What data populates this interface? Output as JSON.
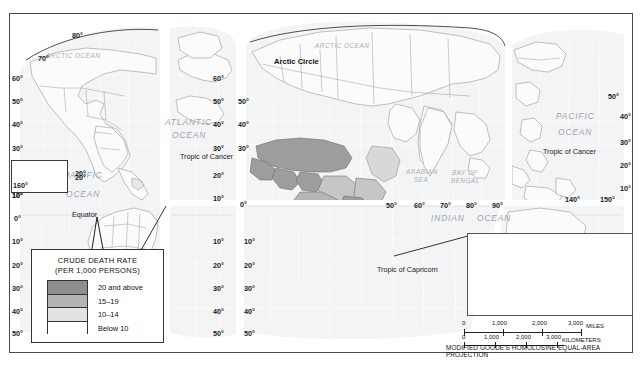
{
  "map": {
    "projection_note": "MODIFIED GOODE'S HOMOLOSINE EQUAL-AREA PROJECTION",
    "legend": {
      "title_line1": "CRUDE DEATH RATE",
      "title_line2": "(PER 1,000 PERSONS)",
      "classes": [
        {
          "label": "20 and above",
          "color": "#8e8e8e"
        },
        {
          "label": "15–19",
          "color": "#b4b4b4"
        },
        {
          "label": "10–14",
          "color": "#e2e2e2"
        },
        {
          "label": "Below 10",
          "color": "#ffffff"
        }
      ]
    },
    "ocean_labels": [
      {
        "text": "ARCTIC OCEAN",
        "x": 46,
        "y": 53,
        "size": "small"
      },
      {
        "text": "ARCTIC OCEAN",
        "x": 315,
        "y": 43,
        "size": "small"
      },
      {
        "text": "ATLANTIC",
        "x": 165,
        "y": 118,
        "size": "big"
      },
      {
        "text": "OCEAN",
        "x": 172,
        "y": 131,
        "size": "big"
      },
      {
        "text": "PACIFIC",
        "x": 64,
        "y": 171,
        "size": "big"
      },
      {
        "text": "OCEAN",
        "x": 66,
        "y": 190,
        "size": "big"
      },
      {
        "text": "PACIFIC",
        "x": 556,
        "y": 112,
        "size": "big"
      },
      {
        "text": "OCEAN",
        "x": 558,
        "y": 128,
        "size": "big"
      },
      {
        "text": "INDIAN",
        "x": 431,
        "y": 214,
        "size": "big"
      },
      {
        "text": "OCEAN",
        "x": 477,
        "y": 214,
        "size": "big"
      },
      {
        "text": "ARABIAN",
        "x": 406,
        "y": 169,
        "size": "small"
      },
      {
        "text": "SEA",
        "x": 414,
        "y": 177,
        "size": "small"
      },
      {
        "text": "BAY OF",
        "x": 452,
        "y": 170,
        "size": "small"
      },
      {
        "text": "BENGAL",
        "x": 451,
        "y": 178,
        "size": "small"
      },
      {
        "text": "CORAL SEA",
        "x": 551,
        "y": 250,
        "size": "small"
      }
    ],
    "reference_lines": [
      {
        "text": "Arctic Circle",
        "x": 274,
        "y": 58
      },
      {
        "text": "Equator",
        "x": 72,
        "y": 211
      },
      {
        "text": "Tropic of Cancer",
        "x": 180,
        "y": 153
      },
      {
        "text": "Tropic of Cancer",
        "x": 543,
        "y": 148
      },
      {
        "text": "Tropic of Capricorn",
        "x": 377,
        "y": 266
      }
    ],
    "graticule_labels": [
      {
        "text": "80°",
        "x": 72,
        "y": 32
      },
      {
        "text": "70°",
        "x": 38,
        "y": 55
      },
      {
        "text": "60°",
        "x": 12,
        "y": 75
      },
      {
        "text": "50°",
        "x": 12,
        "y": 98
      },
      {
        "text": "40°",
        "x": 12,
        "y": 121
      },
      {
        "text": "30°",
        "x": 12,
        "y": 145
      },
      {
        "text": "20°",
        "x": 12,
        "y": 168
      },
      {
        "text": "160°",
        "x": 12,
        "y": 180
      },
      {
        "text": "10°",
        "x": 12,
        "y": 192
      },
      {
        "text": "10°",
        "x": 12,
        "y": 192
      },
      {
        "text": "0°",
        "x": 14,
        "y": 215
      },
      {
        "text": "10°",
        "x": 12,
        "y": 238
      },
      {
        "text": "20°",
        "x": 12,
        "y": 262
      },
      {
        "text": "30°",
        "x": 12,
        "y": 285
      },
      {
        "text": "40°",
        "x": 12,
        "y": 308
      },
      {
        "text": "50°",
        "x": 12,
        "y": 330
      },
      {
        "text": "20°",
        "x": 75,
        "y": 174
      },
      {
        "text": "60°",
        "x": 213,
        "y": 75
      },
      {
        "text": "50°",
        "x": 213,
        "y": 98
      },
      {
        "text": "40°",
        "x": 213,
        "y": 121
      },
      {
        "text": "30°",
        "x": 213,
        "y": 145
      },
      {
        "text": "20°",
        "x": 213,
        "y": 172
      },
      {
        "text": "10°",
        "x": 213,
        "y": 195
      },
      {
        "text": "10°",
        "x": 213,
        "y": 238
      },
      {
        "text": "20°",
        "x": 213,
        "y": 262
      },
      {
        "text": "30°",
        "x": 213,
        "y": 285
      },
      {
        "text": "40°",
        "x": 213,
        "y": 308
      },
      {
        "text": "50°",
        "x": 213,
        "y": 330
      },
      {
        "text": "50°",
        "x": 238,
        "y": 98
      },
      {
        "text": "40°",
        "x": 238,
        "y": 121
      },
      {
        "text": "30°",
        "x": 238,
        "y": 145
      },
      {
        "text": "0°",
        "x": 240,
        "y": 201
      },
      {
        "text": "10°",
        "x": 244,
        "y": 238
      },
      {
        "text": "20°",
        "x": 244,
        "y": 262
      },
      {
        "text": "30°",
        "x": 244,
        "y": 285
      },
      {
        "text": "40°",
        "x": 244,
        "y": 308
      },
      {
        "text": "50°",
        "x": 244,
        "y": 330
      },
      {
        "text": "50°",
        "x": 386,
        "y": 202
      },
      {
        "text": "60°",
        "x": 414,
        "y": 202
      },
      {
        "text": "70°",
        "x": 440,
        "y": 202
      },
      {
        "text": "80°",
        "x": 466,
        "y": 202
      },
      {
        "text": "90°",
        "x": 492,
        "y": 202
      },
      {
        "text": "140°",
        "x": 565,
        "y": 196
      },
      {
        "text": "150°",
        "x": 600,
        "y": 196
      },
      {
        "text": "50°",
        "x": 608,
        "y": 93
      },
      {
        "text": "40°",
        "x": 620,
        "y": 113
      },
      {
        "text": "30°",
        "x": 620,
        "y": 139
      },
      {
        "text": "20°",
        "x": 620,
        "y": 162
      },
      {
        "text": "10°",
        "x": 620,
        "y": 185
      },
      {
        "text": "40°",
        "x": 620,
        "y": 288
      },
      {
        "text": "50°",
        "x": 620,
        "y": 310
      }
    ],
    "inset_hawaii": {
      "lon_label": "160°",
      "lat_label": "20°"
    },
    "inset_australia": {
      "labels": [
        {
          "text": "120°",
          "x": 498,
          "y": 239
        },
        {
          "text": "150°",
          "x": 568,
          "y": 239
        },
        {
          "text": "160°",
          "x": 592,
          "y": 239
        },
        {
          "text": "170°",
          "x": 615,
          "y": 239
        },
        {
          "text": "20°",
          "x": 474,
          "y": 253
        },
        {
          "text": "20°",
          "x": 616,
          "y": 253
        },
        {
          "text": "30°",
          "x": 474,
          "y": 277
        },
        {
          "text": "30°",
          "x": 616,
          "y": 277
        },
        {
          "text": "40°",
          "x": 474,
          "y": 299
        },
        {
          "text": "110°",
          "x": 474,
          "y": 308
        },
        {
          "text": "120°",
          "x": 495,
          "y": 308
        },
        {
          "text": "130°",
          "x": 516,
          "y": 308
        },
        {
          "text": "140°",
          "x": 537,
          "y": 308
        },
        {
          "text": "150°",
          "x": 558,
          "y": 308
        },
        {
          "text": "160°",
          "x": 579,
          "y": 308
        },
        {
          "text": "180°",
          "x": 614,
          "y": 308
        }
      ]
    },
    "scale_bar": {
      "miles_unit": "MILES",
      "km_unit": "KILOMETERS",
      "miles_ticks": [
        "0",
        "1,000",
        "2,000",
        "3,000"
      ],
      "km_ticks": [
        "0",
        "1,000",
        "2,000",
        "3,000"
      ]
    }
  }
}
